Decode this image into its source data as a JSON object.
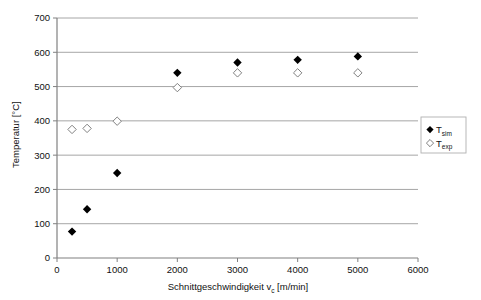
{
  "chart_data": {
    "type": "scatter",
    "title": "",
    "subtitle": "",
    "xlabel": "Schnittgeschwindigkeit v",
    "xlabel_sub": "c",
    "xlabel_unit": " [m/min]",
    "ylabel": "Temperatur [°C]",
    "xlim": [
      0,
      6000
    ],
    "ylim": [
      0,
      700
    ],
    "xticks": [
      "0",
      "1000",
      "2000",
      "3000",
      "4000",
      "5000",
      "6000"
    ],
    "xtick_values": [
      0,
      1000,
      2000,
      3000,
      4000,
      5000,
      6000
    ],
    "yticks": [
      "0",
      "100",
      "200",
      "300",
      "400",
      "500",
      "600",
      "700"
    ],
    "ytick_values": [
      0,
      100,
      200,
      300,
      400,
      500,
      600,
      700
    ],
    "grid": "horizontal",
    "grid_color": "#a6a6a6",
    "axis_color": "#808080",
    "legend_position": "right-middle",
    "series": [
      {
        "name": "T",
        "name_sub": "sim",
        "marker": "filled-diamond",
        "color": "#000000",
        "x": [
          250,
          500,
          1000,
          2000,
          3000,
          4000,
          5000
        ],
        "values": [
          77,
          142,
          248,
          540,
          570,
          578,
          588
        ]
      },
      {
        "name": "T",
        "name_sub": "exp",
        "marker": "open-diamond",
        "color": "#ffffff",
        "edge_color": "#808080",
        "x": [
          250,
          500,
          1000,
          2000,
          3000,
          4000,
          5000
        ],
        "values": [
          375,
          378,
          399,
          497,
          540,
          540,
          540
        ]
      }
    ]
  },
  "legend": {
    "items": [
      {
        "label": "T",
        "sub": "sim",
        "marker": "filled-diamond"
      },
      {
        "label": "T",
        "sub": "exp",
        "marker": "open-diamond"
      }
    ]
  }
}
